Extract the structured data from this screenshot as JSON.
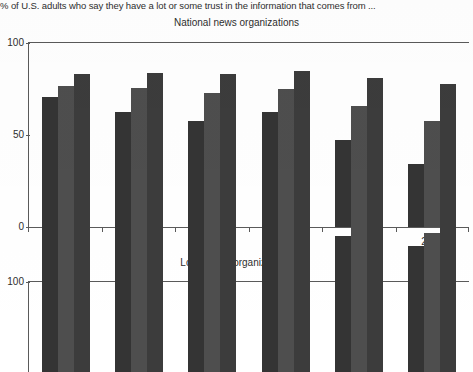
{
  "note": "% of U.S. adults who say they have a lot or some trust in the information that comes from ...",
  "chart_data": [
    {
      "type": "bar",
      "title": "National news organizations",
      "xlabel": "",
      "ylabel": "",
      "ylim": [
        0,
        100
      ],
      "yticks": [
        "0",
        "50",
        "100"
      ],
      "grid": false,
      "legend": "none",
      "categories": [
        "2016",
        "2017",
        "2018",
        "2019",
        "2020",
        "2021"
      ],
      "series": [
        {
          "name": "series-1",
          "color": "#343434",
          "values": [
            70,
            62,
            57,
            62,
            47,
            34
          ]
        },
        {
          "name": "series-2",
          "color": "#4e4e4e",
          "values": [
            76,
            75,
            72,
            74,
            65,
            57
          ]
        },
        {
          "name": "series-3",
          "color": "#3c3c3c",
          "values": [
            82,
            83,
            82,
            84,
            80,
            77
          ]
        }
      ]
    },
    {
      "type": "bar",
      "title": "Local news organizations",
      "xlabel": "",
      "ylabel": "",
      "ylim": [
        0,
        100
      ],
      "yticks": [
        "100"
      ],
      "grid": false,
      "legend": "none",
      "categories": [
        "2016",
        "2017",
        "2018",
        "2019",
        "2020",
        "2021"
      ],
      "series": [
        {
          "name": "series-1",
          "color": "#343434",
          "values": [
            79,
            82,
            79,
            81,
            73,
            68
          ]
        },
        {
          "name": "series-2",
          "color": "#4e4e4e",
          "values": [
            81,
            84,
            82,
            84,
            78,
            75
          ]
        },
        {
          "name": "series-3",
          "color": "#3c3c3c",
          "values": [
            83,
            85,
            85,
            87,
            83,
            82
          ]
        }
      ]
    }
  ]
}
